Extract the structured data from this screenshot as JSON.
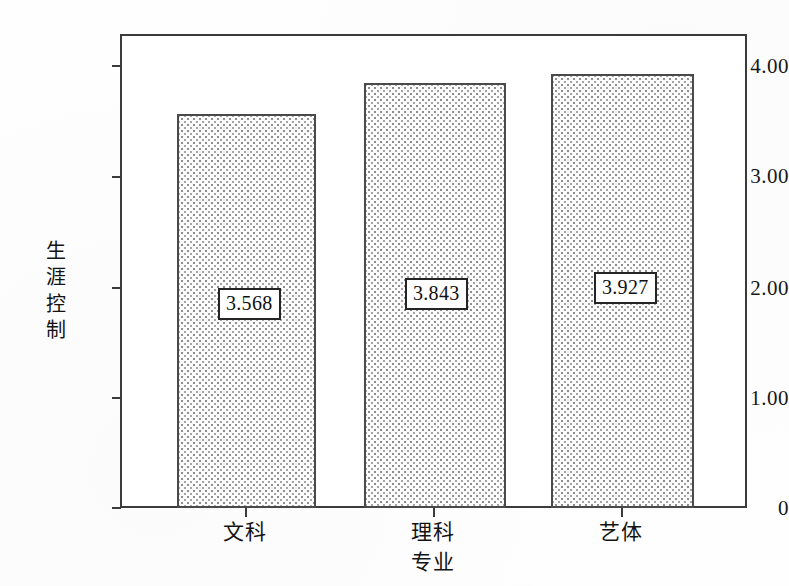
{
  "chart_data": {
    "type": "bar",
    "title": "",
    "subtitle": "",
    "categories": [
      "文科",
      "理科",
      "艺体"
    ],
    "values": [
      3.568,
      3.843,
      3.927
    ],
    "data_labels": [
      "3.568",
      "3.843",
      "3.927"
    ],
    "xlabel": "专业",
    "ylabel": "生涯控制",
    "ylim": [
      0,
      4.25
    ],
    "ytick_labels": [
      "4.00",
      "3.00",
      "2.00",
      "1.00",
      "0"
    ],
    "ytick_values": [
      4.0,
      3.0,
      2.0,
      1.0,
      0
    ],
    "grid": false,
    "legend": false,
    "legend_position": "none",
    "bar_fill": "#fbfbfb",
    "bar_edge_color": "#4a4a4a",
    "frame_color": "#3b3b3b",
    "background": "#ffffff"
  },
  "axis": {
    "y_title_chars": [
      "生",
      "涯",
      "控",
      "制"
    ]
  }
}
